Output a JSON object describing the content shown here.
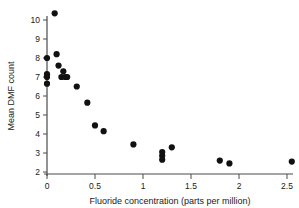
{
  "chart_data": {
    "type": "scatter",
    "title": "",
    "xlabel": "Fluoride concentration (parts per million)",
    "ylabel": "Mean DMF count",
    "xlim": [
      0,
      2.7
    ],
    "ylim": [
      1.6,
      10.7
    ],
    "xticks": [
      0,
      0.5,
      1,
      1.5,
      2,
      2.5
    ],
    "xticklabels": [
      "0",
      "0.5",
      "1",
      "1.5",
      "2",
      "2.5"
    ],
    "yticks": [
      2,
      3,
      4,
      5,
      6,
      7,
      8,
      9,
      10
    ],
    "yticklabels": [
      "2",
      "3",
      "4",
      "5",
      "6",
      "7",
      "8",
      "9",
      "10"
    ],
    "grid": false,
    "legend": null,
    "marker": "filled-circle",
    "marker_color": "#111111",
    "points": [
      {
        "x": 0.0,
        "y": 8.0
      },
      {
        "x": 0.0,
        "y": 7.15
      },
      {
        "x": 0.0,
        "y": 7.0
      },
      {
        "x": 0.0,
        "y": 6.65
      },
      {
        "x": 0.08,
        "y": 10.35
      },
      {
        "x": 0.1,
        "y": 8.2
      },
      {
        "x": 0.12,
        "y": 7.6
      },
      {
        "x": 0.15,
        "y": 7.0
      },
      {
        "x": 0.17,
        "y": 7.3
      },
      {
        "x": 0.19,
        "y": 7.0
      },
      {
        "x": 0.21,
        "y": 7.0
      },
      {
        "x": 0.31,
        "y": 6.5
      },
      {
        "x": 0.42,
        "y": 5.65
      },
      {
        "x": 0.5,
        "y": 4.45
      },
      {
        "x": 0.59,
        "y": 4.15
      },
      {
        "x": 0.9,
        "y": 3.45
      },
      {
        "x": 1.2,
        "y": 3.05
      },
      {
        "x": 1.2,
        "y": 2.85
      },
      {
        "x": 1.2,
        "y": 2.65
      },
      {
        "x": 1.3,
        "y": 3.3
      },
      {
        "x": 1.8,
        "y": 2.6
      },
      {
        "x": 1.9,
        "y": 2.45
      },
      {
        "x": 2.55,
        "y": 2.55
      }
    ]
  },
  "axes": {
    "x_axis_name": "x-axis",
    "y_axis_name": "y-axis"
  }
}
